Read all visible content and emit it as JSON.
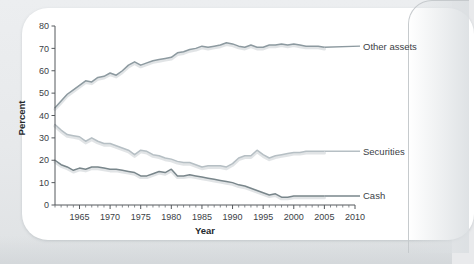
{
  "chart_data": {
    "type": "line",
    "title": "",
    "xlabel": "Year",
    "ylabel": "Percent",
    "xlim": [
      1961,
      2010
    ],
    "ylim": [
      0,
      80
    ],
    "ytick_values": [
      0,
      10,
      20,
      30,
      40,
      50,
      60,
      70,
      80
    ],
    "ytick_labels": [
      "0",
      "10",
      "20",
      "30",
      "40",
      "50",
      "60",
      "70",
      "80"
    ],
    "xtick_values": [
      1965,
      1970,
      1975,
      1980,
      1985,
      1990,
      1995,
      2000,
      2005,
      2010
    ],
    "xtick_labels": [
      "1965",
      "1970",
      "1975",
      "1980",
      "1985",
      "1990",
      "1995",
      "2000",
      "2005",
      "2010"
    ],
    "xtick_minor_step": 1,
    "grid": false,
    "legend_position": "right-inline-labels",
    "x": [
      1961,
      1962,
      1963,
      1964,
      1965,
      1966,
      1967,
      1968,
      1969,
      1970,
      1971,
      1972,
      1973,
      1974,
      1975,
      1976,
      1977,
      1978,
      1979,
      1980,
      1981,
      1982,
      1983,
      1984,
      1985,
      1986,
      1987,
      1988,
      1989,
      1990,
      1991,
      1992,
      1993,
      1994,
      1995,
      1996,
      1997,
      1998,
      1999,
      2000,
      2001,
      2002,
      2003,
      2004,
      2005
    ],
    "series": [
      {
        "name": "Other assets",
        "color": "#8d9aa0",
        "values": [
          43.5,
          46.5,
          49.5,
          51.5,
          53.5,
          55.5,
          55.0,
          57.0,
          57.5,
          59.0,
          58.0,
          60.0,
          62.5,
          64.0,
          62.5,
          63.5,
          64.5,
          65.0,
          65.5,
          66.0,
          68.0,
          68.5,
          69.5,
          70.0,
          71.0,
          70.5,
          71.0,
          71.5,
          72.5,
          72.0,
          71.0,
          70.5,
          71.5,
          70.5,
          70.5,
          71.5,
          71.5,
          72.0,
          71.5,
          72.0,
          71.5,
          71.0,
          71.0,
          71.0,
          70.5
        ]
      },
      {
        "name": "Securities",
        "color": "#b6bfc4",
        "values": [
          36.0,
          33.5,
          31.5,
          31.0,
          30.5,
          28.5,
          30.0,
          28.5,
          27.5,
          27.5,
          26.5,
          25.5,
          24.5,
          22.5,
          24.5,
          24.0,
          22.5,
          22.0,
          21.0,
          20.5,
          19.5,
          19.0,
          19.0,
          18.0,
          17.0,
          17.5,
          17.5,
          17.5,
          17.0,
          18.5,
          21.0,
          22.0,
          22.0,
          24.5,
          22.5,
          21.0,
          22.0,
          22.5,
          23.0,
          23.5,
          23.5,
          24.0,
          24.0,
          24.0,
          24.0
        ]
      },
      {
        "name": "Cash",
        "color": "#79868b",
        "values": [
          20.0,
          18.0,
          17.0,
          15.5,
          16.5,
          16.0,
          17.0,
          17.0,
          16.5,
          16.0,
          16.0,
          15.5,
          15.0,
          14.5,
          13.0,
          13.0,
          14.0,
          15.0,
          14.5,
          16.0,
          13.0,
          13.0,
          13.5,
          13.0,
          12.5,
          12.0,
          11.5,
          11.0,
          10.5,
          10.0,
          9.0,
          8.5,
          7.5,
          6.5,
          5.5,
          4.5,
          5.0,
          3.5,
          3.5,
          4.0,
          4.0,
          4.0,
          4.0,
          4.0,
          4.0
        ]
      }
    ],
    "annotations": [
      {
        "text": "Other assets",
        "x": 2010,
        "y": 71,
        "anchor": "left"
      },
      {
        "text": "Securities",
        "x": 2010,
        "y": 24,
        "anchor": "left"
      },
      {
        "text": "Cash",
        "x": 2010,
        "y": 4,
        "anchor": "left"
      }
    ]
  }
}
